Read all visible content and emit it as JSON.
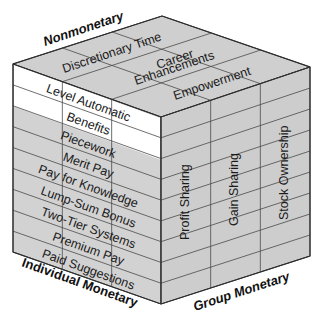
{
  "axes": {
    "top": "Nonmonetary",
    "left": "Individual Monetary",
    "right": "Group Monetary"
  },
  "top_face_items": [
    "Discretionary Time",
    "Career",
    "Enhancements",
    "Empowerment"
  ],
  "left_face_items": [
    {
      "label": "Level Automatic",
      "highlight": true
    },
    {
      "label": "Benefits",
      "highlight": true
    },
    {
      "label": "Piecework",
      "highlight": false
    },
    {
      "label": "Merit Pay",
      "highlight": false
    },
    {
      "label": "Pay for Knowledge",
      "highlight": false
    },
    {
      "label": "Lump-Sum Bonus",
      "highlight": false
    },
    {
      "label": "Two-Tier Systems",
      "highlight": false
    },
    {
      "label": "Premium Pay",
      "highlight": false
    },
    {
      "label": "Paid Suggestions",
      "highlight": false
    }
  ],
  "right_face_items": [
    "Profit Sharing",
    "Gain Sharing",
    "Stock Ownership"
  ],
  "colors": {
    "face_fill": "#d0d0d0",
    "highlight_fill": "#ffffff",
    "line": "#3a3a3a"
  }
}
